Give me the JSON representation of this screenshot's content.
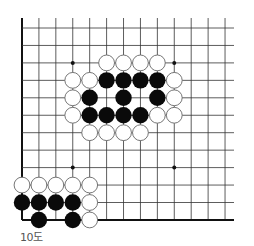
{
  "diagram": {
    "caption": "10도",
    "board": {
      "columns": 13,
      "rows": 12,
      "origin_x": 22,
      "origin_y": 28,
      "spacing_x": 16.92,
      "spacing_y": 17.45,
      "line_top": 18,
      "line_right": 234,
      "edges": [
        "left",
        "bottom"
      ],
      "line_color": "#333333",
      "edge_color": "#111111"
    },
    "star_points": [
      {
        "col": 3,
        "row": 2
      },
      {
        "col": 9,
        "row": 2
      },
      {
        "col": 3,
        "row": 8
      },
      {
        "col": 9,
        "row": 8
      }
    ],
    "stones": [
      {
        "color": "white",
        "col": 5,
        "row": 2
      },
      {
        "color": "white",
        "col": 6,
        "row": 2
      },
      {
        "color": "white",
        "col": 7,
        "row": 2
      },
      {
        "color": "white",
        "col": 8,
        "row": 2
      },
      {
        "color": "white",
        "col": 3,
        "row": 3
      },
      {
        "color": "white",
        "col": 4,
        "row": 3
      },
      {
        "color": "black",
        "col": 5,
        "row": 3
      },
      {
        "color": "black",
        "col": 6,
        "row": 3
      },
      {
        "color": "black",
        "col": 7,
        "row": 3
      },
      {
        "color": "black",
        "col": 8,
        "row": 3
      },
      {
        "color": "white",
        "col": 9,
        "row": 3
      },
      {
        "color": "white",
        "col": 3,
        "row": 4
      },
      {
        "color": "black",
        "col": 4,
        "row": 4
      },
      {
        "color": "black",
        "col": 6,
        "row": 4
      },
      {
        "color": "black",
        "col": 8,
        "row": 4
      },
      {
        "color": "white",
        "col": 9,
        "row": 4
      },
      {
        "color": "white",
        "col": 3,
        "row": 5
      },
      {
        "color": "black",
        "col": 4,
        "row": 5
      },
      {
        "color": "black",
        "col": 5,
        "row": 5
      },
      {
        "color": "black",
        "col": 6,
        "row": 5
      },
      {
        "color": "black",
        "col": 7,
        "row": 5
      },
      {
        "color": "white",
        "col": 8,
        "row": 5
      },
      {
        "color": "white",
        "col": 9,
        "row": 5
      },
      {
        "color": "white",
        "col": 4,
        "row": 6
      },
      {
        "color": "white",
        "col": 5,
        "row": 6
      },
      {
        "color": "white",
        "col": 6,
        "row": 6
      },
      {
        "color": "white",
        "col": 7,
        "row": 6
      },
      {
        "color": "white",
        "col": 0,
        "row": 9
      },
      {
        "color": "white",
        "col": 1,
        "row": 9
      },
      {
        "color": "white",
        "col": 2,
        "row": 9
      },
      {
        "color": "white",
        "col": 3,
        "row": 9
      },
      {
        "color": "white",
        "col": 4,
        "row": 9
      },
      {
        "color": "black",
        "col": 0,
        "row": 10
      },
      {
        "color": "black",
        "col": 1,
        "row": 10
      },
      {
        "color": "black",
        "col": 2,
        "row": 10
      },
      {
        "color": "black",
        "col": 3,
        "row": 10
      },
      {
        "color": "white",
        "col": 4,
        "row": 10
      },
      {
        "color": "black",
        "col": 1,
        "row": 11
      },
      {
        "color": "black",
        "col": 3,
        "row": 11
      },
      {
        "color": "white",
        "col": 4,
        "row": 11
      }
    ],
    "colors": {
      "black_stone": "#0a0a0a",
      "white_stone": "#ffffff",
      "white_outline": "#666666"
    }
  }
}
